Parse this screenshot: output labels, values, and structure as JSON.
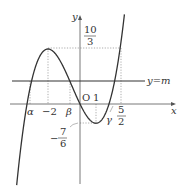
{
  "diagram": {
    "function": "y = (1/3)x^3 + (1/2)x^2 - 2x",
    "axes": {
      "x_label": "x",
      "y_label": "y",
      "origin_label": "O"
    },
    "line": {
      "label": "y=m"
    },
    "x_ticks": [
      {
        "label": "α",
        "value": -3.1
      },
      {
        "label": "−2",
        "value": -2
      },
      {
        "label": "β",
        "value": -0.6
      },
      {
        "label": "1",
        "value": 1
      },
      {
        "label": "γ",
        "value": 2.05
      },
      {
        "label": "5/2",
        "value": 2.5
      }
    ],
    "labels": {
      "max_value_num": "10",
      "max_value_den": "3",
      "min_value_sign": "−",
      "min_value_num": "7",
      "min_value_den": "6",
      "five_half_num": "5",
      "five_half_den": "2",
      "alpha": "α",
      "beta": "β",
      "gamma": "γ",
      "minus_two": "−2",
      "one": "1"
    },
    "extrema": {
      "max": {
        "x": -2,
        "y": "10/3"
      },
      "min": {
        "x": 1,
        "y": "-7/6"
      }
    },
    "colors": {
      "curve": "#333333",
      "axis": "#555555",
      "dotted": "#888888"
    }
  }
}
